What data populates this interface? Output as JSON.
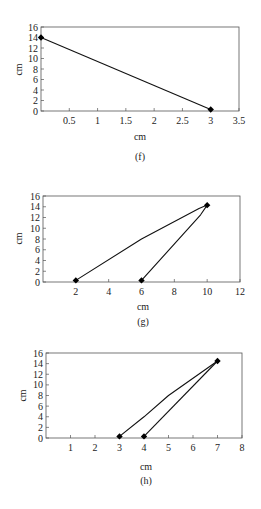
{
  "chart_data": [
    {
      "type": "line",
      "id": "f",
      "caption": "(f)",
      "xlabel": "cm",
      "ylabel": "cm",
      "xlim": [
        0,
        3.5
      ],
      "ylim": [
        0,
        16
      ],
      "xticks": [
        0.5,
        1,
        1.5,
        2,
        2.5,
        3,
        3.5
      ],
      "xtick_labels": [
        "0.5",
        "1",
        "1.5",
        "2",
        "2.5",
        "3",
        "3.5"
      ],
      "yticks": [
        0,
        2,
        4,
        6,
        8,
        10,
        12,
        14,
        16
      ],
      "ytick_labels": [
        "0",
        "2",
        "4",
        "6",
        "8",
        "10",
        "12",
        "14",
        "16"
      ],
      "grid": false,
      "series": [
        {
          "name": "path",
          "x": [
            0,
            3
          ],
          "y": [
            14,
            0.3
          ],
          "markers": [
            [
              0,
              14
            ],
            [
              3,
              0.3
            ]
          ]
        }
      ]
    },
    {
      "type": "line",
      "id": "g",
      "caption": "(g)",
      "xlabel": "cm",
      "ylabel": "cm",
      "xlim": [
        0,
        12
      ],
      "ylim": [
        0,
        16
      ],
      "xticks": [
        2,
        4,
        6,
        8,
        10,
        12
      ],
      "xtick_labels": [
        "2",
        "4",
        "6",
        "8",
        "10",
        "12"
      ],
      "yticks": [
        0,
        2,
        4,
        6,
        8,
        10,
        12,
        14,
        16
      ],
      "ytick_labels": [
        "0",
        "2",
        "4",
        "6",
        "8",
        "10",
        "12",
        "14",
        "16"
      ],
      "grid": false,
      "series": [
        {
          "name": "upper",
          "x": [
            2,
            6,
            9.5,
            10
          ],
          "y": [
            0.3,
            8,
            13.7,
            14.3
          ]
        },
        {
          "name": "lower",
          "x": [
            10,
            9.6,
            6
          ],
          "y": [
            14.3,
            12.5,
            0.3
          ]
        }
      ],
      "markers": [
        [
          2,
          0.3
        ],
        [
          6,
          0.3
        ],
        [
          10,
          14.3
        ]
      ]
    },
    {
      "type": "line",
      "id": "h",
      "caption": "(h)",
      "xlabel": "cm",
      "ylabel": "cm",
      "xlim": [
        0,
        8
      ],
      "ylim": [
        0,
        16
      ],
      "xticks": [
        1,
        2,
        3,
        4,
        5,
        6,
        7,
        8
      ],
      "xtick_labels": [
        "1",
        "2",
        "3",
        "4",
        "5",
        "6",
        "7",
        "8"
      ],
      "yticks": [
        0,
        2,
        4,
        6,
        8,
        10,
        12,
        14,
        16
      ],
      "ytick_labels": [
        "0",
        "2",
        "4",
        "6",
        "8",
        "10",
        "12",
        "14",
        "16"
      ],
      "grid": false,
      "series": [
        {
          "name": "upper",
          "x": [
            3,
            4,
            5,
            7
          ],
          "y": [
            0.3,
            4,
            8,
            14.5
          ]
        },
        {
          "name": "lower",
          "x": [
            7,
            4
          ],
          "y": [
            14.5,
            0.3
          ]
        }
      ],
      "markers": [
        [
          3,
          0.3
        ],
        [
          4,
          0.3
        ],
        [
          7,
          14.5
        ]
      ]
    }
  ],
  "charts": {
    "f": {
      "caption": "(f)",
      "xlabel": "cm",
      "ylabel": "cm"
    },
    "g": {
      "caption": "(g)",
      "xlabel": "cm",
      "ylabel": "cm"
    },
    "h": {
      "caption": "(h)",
      "xlabel": "cm",
      "ylabel": "cm"
    }
  }
}
